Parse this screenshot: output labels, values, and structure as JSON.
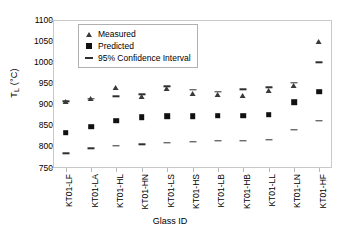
{
  "chart_data": {
    "type": "scatter",
    "title": "",
    "xlabel": "Glass ID",
    "ylabel": "T_L (°C)",
    "ylabel_base": "T",
    "ylabel_sub": "L",
    "ylabel_unit": " (°C)",
    "ylim": [
      750,
      1100
    ],
    "yticks": [
      750,
      800,
      850,
      900,
      950,
      1000,
      1050,
      1100
    ],
    "grid": false,
    "legend_position": "top-center-inside",
    "categories": [
      "KT01-LF",
      "KT01-LA",
      "KT01-HL",
      "KT01-HN",
      "KT01-LS",
      "KT01-HS",
      "KT01-LB",
      "KT01-HB",
      "KT01-LL",
      "KT01-LN",
      "KT01-HF"
    ],
    "series": [
      {
        "name": "Measured",
        "marker": "triangle",
        "values": [
          905,
          912,
          940,
          917,
          937,
          925,
          922,
          920,
          932,
          943,
          1048
        ]
      },
      {
        "name": "Predicted",
        "marker": "square",
        "values": [
          833,
          848,
          862,
          870,
          872,
          872,
          874,
          874,
          876,
          905,
          930
        ]
      },
      {
        "name": "95% Confidence Interval",
        "marker": "dash",
        "upper": [
          908,
          914,
          920,
          924,
          943,
          935,
          930,
          936,
          941,
          952,
          1000
        ],
        "lower": [
          785,
          797,
          803,
          806,
          810,
          812,
          815,
          815,
          816,
          840,
          862
        ]
      }
    ],
    "legend": [
      {
        "label": "Measured",
        "marker": "triangle"
      },
      {
        "label": "Predicted",
        "marker": "square"
      },
      {
        "label": "95% Confidence Interval",
        "marker": "dash"
      }
    ]
  }
}
